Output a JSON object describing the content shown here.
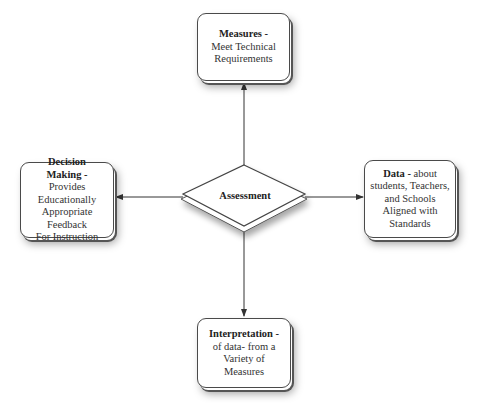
{
  "diagram": {
    "center": {
      "label": "Assessment",
      "shape": "diamond"
    },
    "nodes": {
      "top": {
        "title": "Measures -",
        "body": [
          "Meet Technical",
          "Requirements"
        ]
      },
      "left": {
        "title": [
          "Decision",
          "Making -"
        ],
        "body": [
          "Provides Educationally",
          "Appropriate Feedback",
          "For Instruction"
        ]
      },
      "right": {
        "title": "Data -",
        "title_suffix": " about",
        "body": [
          "students, Teachers,",
          "and Schools",
          "Aligned with",
          "Standards"
        ]
      },
      "bottom": {
        "title": "Interpretation -",
        "body": [
          "of data- from a",
          "Variety of",
          "Measures"
        ]
      }
    },
    "edges": [
      {
        "from": "Assessment",
        "to": "Measures",
        "direction": "up"
      },
      {
        "from": "Assessment",
        "to": "Decision Making",
        "direction": "left"
      },
      {
        "from": "Assessment",
        "to": "Data",
        "direction": "right"
      },
      {
        "from": "Assessment",
        "to": "Interpretation",
        "direction": "down"
      }
    ],
    "colors": {
      "stroke": "#4a4a4a",
      "fill": "#ffffff",
      "text": "#222222"
    }
  }
}
